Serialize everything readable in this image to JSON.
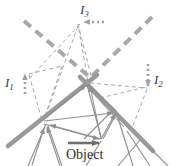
{
  "figure": {
    "kind": "ray-diagram",
    "background_color": "#ffffff",
    "colors": {
      "mirror": "#9a9a9a",
      "ray": "#8f8f8f",
      "construction_dash": "#9e9e9e",
      "thick_dash": "#a8a8a8",
      "dotted_pointer": "#a0a0a0",
      "text": "#3a3a3a"
    },
    "labels": {
      "image_1": {
        "base": "I",
        "sub": "1"
      },
      "image_2": {
        "base": "I",
        "sub": "2"
      },
      "image_3": {
        "base": "I",
        "sub": "3"
      },
      "object": "Object"
    },
    "elements": {
      "mirrors": [
        {
          "name": "left-mirror",
          "from": [
            8,
            146
          ],
          "to": [
            96,
            76
          ]
        },
        {
          "name": "right-mirror",
          "from": [
            80,
            78
          ],
          "to": [
            152,
            150
          ]
        }
      ],
      "thick_dashed_extensions": [
        {
          "name": "left-mirror-extension",
          "from": [
            24,
            21
          ],
          "to": [
            92,
            80
          ]
        },
        {
          "name": "right-mirror-extension",
          "from": [
            152,
            17
          ],
          "to": [
            86,
            81
          ]
        }
      ],
      "vertices": {
        "left-node": [
          42,
          122
        ],
        "apex-node": [
          88,
          81
        ],
        "object-node": [
          101,
          140
        ],
        "right-node": [
          117,
          112
        ]
      },
      "pointers": [
        {
          "name": "pointer-I1",
          "type": "dotted-arrow",
          "from": [
            25,
            93
          ],
          "to": [
            25,
            73
          ],
          "direction": "up"
        },
        {
          "name": "pointer-I2",
          "type": "dotted-arrow",
          "from": [
            148,
            66
          ],
          "to": [
            148,
            88
          ],
          "direction": "down"
        },
        {
          "name": "pointer-I3",
          "type": "dotted-arrow",
          "from": [
            104,
            22
          ],
          "to": [
            84,
            22
          ],
          "direction": "left"
        },
        {
          "name": "pointer-object",
          "type": "solid-arrow",
          "from": [
            68,
            143
          ],
          "to": [
            102,
            143
          ],
          "direction": "right"
        }
      ]
    }
  }
}
